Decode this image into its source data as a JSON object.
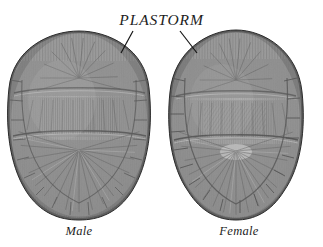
{
  "figure": {
    "width": 323,
    "height": 247,
    "background_color": "#ffffff",
    "style": "grayscale engraving"
  },
  "callout": {
    "label": "PLASTORM",
    "leader_lines": [
      {
        "name": "leader-line-male",
        "x1": 133,
        "y1": 31,
        "x2": 121,
        "y2": 53
      },
      {
        "name": "leader-line-female",
        "x1": 180,
        "y1": 31,
        "x2": 197,
        "y2": 53
      }
    ],
    "line_color": "#151515"
  },
  "specimens": [
    {
      "id": "male",
      "caption": "Male",
      "outline": {
        "cx": 79,
        "cy": 125,
        "rx": 70,
        "ry": 92
      },
      "shape_note": "broader, rounder plastron",
      "tone_dark": "#3c3c3c",
      "tone_mid": "#76767 6",
      "tone_light": "#b4b4b4"
    },
    {
      "id": "female",
      "caption": "Female",
      "outline": {
        "cx": 236,
        "cy": 125,
        "rx": 65,
        "ry": 93
      },
      "shape_note": "narrower, more oval plastron with pronounced marginal scutes",
      "tone_dark": "#3c3c3c",
      "tone_mid": "#767676",
      "tone_light": "#b4b4b4"
    }
  ],
  "colors": {
    "background": "#ffffff",
    "ink": "#1d1d1d",
    "shell_dark": "#3a3a3a",
    "shell_mid": "#737373",
    "shell_light": "#a9a9a9",
    "shell_highlight": "#cfcfcf"
  }
}
